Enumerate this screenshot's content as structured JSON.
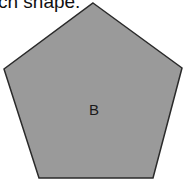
{
  "caption": {
    "text": "ch shape."
  },
  "shape": {
    "type": "pentagon",
    "label": "B",
    "fill": "#9a9a9a",
    "stroke": "#2a2a2a",
    "points": "93,3 182,68 153,178 39,178 4,69",
    "label_x": 94,
    "label_y": 115
  }
}
